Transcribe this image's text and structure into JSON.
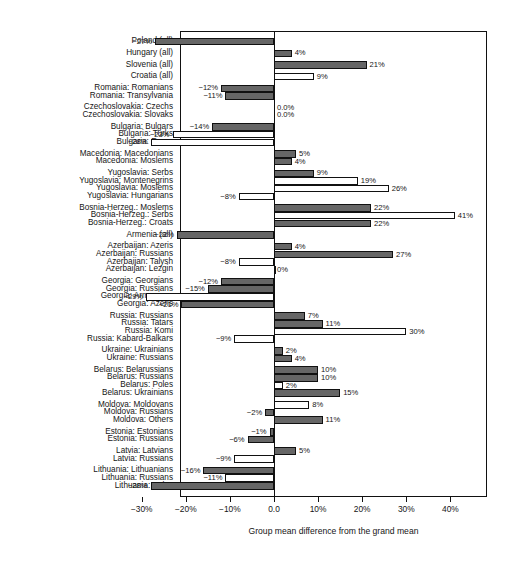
{
  "chart_data": {
    "type": "bar",
    "title": "",
    "subtitle": "",
    "xlabel": "Group mean difference from the grand mean",
    "ylabel": "",
    "orientation": "horizontal",
    "xlim": [
      -33,
      46
    ],
    "xticks": [
      -30,
      -20,
      -10,
      0,
      10,
      20,
      30,
      40
    ],
    "xticklabels": [
      "−30%",
      "−20%",
      "−10%",
      "0.0",
      "10%",
      "20%",
      "30%",
      "40%"
    ],
    "grid": false,
    "legend": "none",
    "series_styles": {
      "filled": "#666666",
      "hollow": "#ffffff",
      "outline": "#111111"
    },
    "categories": [
      "Poland (all)",
      "Hungary (all)",
      "Slovenia (all)",
      "Croatia (all)",
      "Romania: Romanians",
      "Romania: Transylvania",
      "Czechoslovakia: Czechs",
      "Czechoslovakia: Slovaks",
      "Bulgaria: Bulgars",
      "Bulgaria: Turks",
      "Bulgaria: Roma",
      "Macedonia: Macedonians",
      "Macedonia: Moslems",
      "Yugoslavia: Serbs",
      "Yugoslavia: Montenegrins",
      "Yugoslavia: Moslems",
      "Yugoslavia: Hungarians",
      "Bosnia-Herzeg.: Moslems",
      "Bosnia-Herzeg.: Serbs",
      "Bosnia-Herzeg.: Croats",
      "Armenia (all)",
      "Azerbaijan: Azeris",
      "Azerbaijan: Russians",
      "Azerbaijan: Talysh",
      "Azerbaijan: Lezgin",
      "Georgia: Georgians",
      "Georgia: Russians",
      "Georgia: Armenians",
      "Georgia: Azeris",
      "Russia: Russians",
      "Russia: Tatars",
      "Russia: Komi",
      "Russia: Kabard-Balkars",
      "Ukraine: Ukrainians",
      "Ukraine: Russians",
      "Belarus: Belarussians",
      "Belarus: Russians",
      "Belarus: Poles",
      "Belarus: Ukrainians",
      "Moldova: Moldovans",
      "Moldova: Russians",
      "Moldova: Others",
      "Estonia: Estonians",
      "Estonia: Russians",
      "Latvia: Latvians",
      "Latvia: Russians",
      "Lithuania: Lithuanians",
      "Lithuania: Russians",
      "Lithuania: Poles"
    ],
    "values": [
      -27,
      4,
      21,
      9,
      -12,
      -11,
      0,
      0,
      -14,
      -23,
      -28,
      5,
      4,
      9,
      19,
      26,
      -8,
      22,
      41,
      22,
      -22,
      4,
      27,
      -8,
      0,
      -12,
      -15,
      -29,
      -21,
      7,
      11,
      30,
      -9,
      2,
      4,
      10,
      10,
      2,
      15,
      8,
      -2,
      11,
      -1,
      -6,
      5,
      -9,
      -16,
      -11,
      -28
    ],
    "labels": [
      "−27%",
      "4%",
      "21%",
      "9%",
      "−12%",
      "−11%",
      "0.0%",
      "0.0%",
      "−14%",
      "−23%",
      "−28%",
      "5%",
      "4%",
      "9%",
      "19%",
      "26%",
      "−8%",
      "22%",
      "41%",
      "22%",
      "−22%",
      "4%",
      "27%",
      "−8%",
      "0%",
      "−12%",
      "−15%",
      "−29%",
      "−21%",
      "7%",
      "11%",
      "30%",
      "−9%",
      "2%",
      "4%",
      "10%",
      "10%",
      "2%",
      "15%",
      "8%",
      "−2%",
      "11%",
      "−1%",
      "−6%",
      "5%",
      "−9%",
      "−16%",
      "−11%",
      "−28%"
    ],
    "styles": [
      "filled",
      "filled",
      "filled",
      "hollow",
      "filled",
      "filled",
      "none",
      "none",
      "filled",
      "hollow",
      "hollow",
      "filled",
      "filled",
      "filled",
      "hollow",
      "hollow",
      "hollow",
      "filled",
      "hollow",
      "filled",
      "filled",
      "filled",
      "filled",
      "hollow",
      "hollow",
      "filled",
      "filled",
      "hollow",
      "filled",
      "filled",
      "filled",
      "hollow",
      "hollow",
      "filled",
      "filled",
      "filled",
      "filled",
      "hollow",
      "filled",
      "hollow",
      "filled",
      "filled",
      "filled",
      "filled",
      "filled",
      "hollow",
      "filled",
      "hollow",
      "filled"
    ],
    "group_gaps_after": [
      0,
      1,
      2,
      3,
      5,
      7,
      10,
      12,
      16,
      19,
      20,
      24,
      28,
      32,
      34,
      38,
      41,
      43,
      45
    ]
  }
}
